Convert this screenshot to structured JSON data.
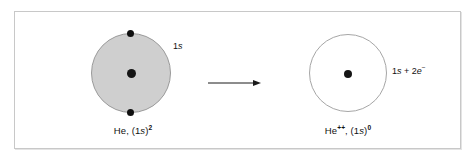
{
  "figure": {
    "caption_present": false,
    "border_color": "#c8c8c8",
    "background": "#ffffff"
  },
  "diagram": {
    "type": "atomic-orbital-ionization",
    "arrow": {
      "name": "reaction-arrow",
      "direction": "right",
      "color": "#1a1a1a"
    },
    "left_atom": {
      "name": "helium-neutral",
      "orbital_fill": "#cfcfcf",
      "orbital_stroke": "#9a9a9a",
      "orbital_state": "filled",
      "nucleus_color": "#151515",
      "electron_count": 2,
      "electron_color": "#101010",
      "orbital_label": {
        "prefix": "1",
        "italic": "s"
      },
      "species_label": {
        "element": "He,",
        "open": " (1",
        "italic": "s",
        "close": ")",
        "superscript": "2"
      }
    },
    "right_atom": {
      "name": "helium-doubly-ionized",
      "orbital_fill": "#ffffff",
      "orbital_stroke": "#a6a6a6",
      "orbital_state": "empty",
      "nucleus_color": "#151515",
      "electron_count": 0,
      "orbital_label": {
        "prefix": "1",
        "italic": "s",
        "operator": " + 2",
        "italic2": "e",
        "superscript": "−"
      },
      "species_label": {
        "element": "He",
        "charge": "++",
        "comma": ", (1",
        "italic": "s",
        "close": ")",
        "superscript": "0"
      }
    }
  }
}
